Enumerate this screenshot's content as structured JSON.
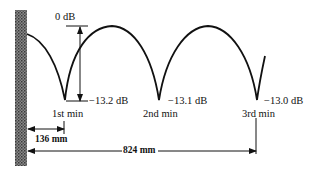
{
  "diagram": {
    "type": "standing-wave-pattern",
    "reference_label": "0 dB",
    "minima": [
      {
        "name": "1st min",
        "level": "−13.2 dB"
      },
      {
        "name": "2nd min",
        "level": "−13.1 dB"
      },
      {
        "name": "3rd min",
        "level": "−13.0 dB"
      }
    ],
    "distances": {
      "first_min": "136 mm",
      "third_min": "824 mm"
    },
    "colors": {
      "line": "#111111",
      "wall": "#6b6b6b"
    }
  }
}
